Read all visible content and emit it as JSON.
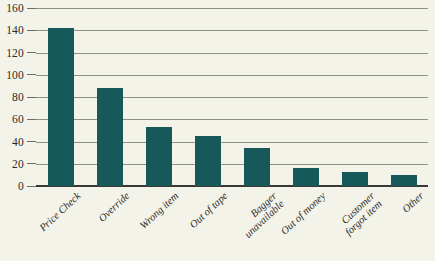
{
  "chart_data": {
    "type": "bar",
    "title": "",
    "subtitle": "",
    "xlabel": "",
    "ylabel": "",
    "ylim": [
      0,
      160
    ],
    "ytick_step": 20,
    "yticks": [
      0,
      20,
      40,
      60,
      80,
      100,
      120,
      140,
      160
    ],
    "grid": true,
    "legend": null,
    "categories": [
      "Price Check",
      "Override",
      "Wrong item",
      "Out of tape",
      "Bagger unavailable",
      "Out of money",
      "Customer forgot item",
      "Other"
    ],
    "category_lines": [
      [
        "Price Check"
      ],
      [
        "Override"
      ],
      [
        "Wrong item"
      ],
      [
        "Out of tape"
      ],
      [
        "Bagger",
        "unavailable"
      ],
      [
        "Out of money"
      ],
      [
        "Customer",
        "forgot item"
      ],
      [
        "Other"
      ]
    ],
    "values": [
      142,
      88,
      53,
      45,
      34,
      16,
      13,
      10
    ],
    "colors": {
      "bar": "#17585a",
      "background": "#f4f3ea",
      "gridline": "#8f9088",
      "baseline": "#3a3a34",
      "text": "#2b2b26"
    }
  }
}
